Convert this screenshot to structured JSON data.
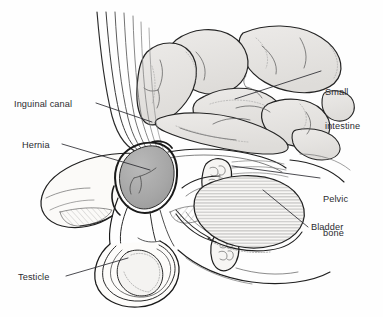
{
  "figure": {
    "style": "medical line drawing, grayscale",
    "background_color": "#fefefe",
    "ink_color": "#1a1a1a",
    "text_color": "#2b2b30"
  },
  "labels": [
    {
      "id": "inguinal-canal",
      "text": "Inguinal canal",
      "side": "left",
      "lines": [
        "Inguinal canal"
      ]
    },
    {
      "id": "hernia",
      "text": "Hernia",
      "side": "left",
      "lines": [
        "Hernia"
      ]
    },
    {
      "id": "testicle",
      "text": "Testicle",
      "side": "left",
      "lines": [
        "Testicle"
      ]
    },
    {
      "id": "small-intestine",
      "text": "Small intestine",
      "side": "right",
      "lines": [
        "Small",
        "intestine"
      ]
    },
    {
      "id": "pelvic-bone",
      "text": "Pelvic bone",
      "side": "right",
      "lines": [
        "Pelvic",
        "bone"
      ]
    },
    {
      "id": "bladder",
      "text": "Bladder",
      "side": "right",
      "lines": [
        "Bladder"
      ]
    }
  ],
  "label_text": {
    "inguinal_canal": "Inguinal canal",
    "hernia": "Hernia",
    "testicle": "Testicle",
    "small_intestine_line1": "Small",
    "small_intestine_line2": "intestine",
    "pelvic_bone_line1": "Pelvic",
    "pelvic_bone_line2": "bone",
    "bladder": "Bladder"
  },
  "structures": [
    {
      "name": "small-intestine",
      "fill": "#e6e5e3",
      "note": "coiled loops of bowel filling the upper right abdomen"
    },
    {
      "name": "hernia-sac",
      "fill": "#a9a9a9",
      "note": "darker shaded teardrop bulge protruding through the canal"
    },
    {
      "name": "pelvic-bone",
      "fill": "#f4f3f1",
      "note": "two cut cross-sections with trabecular stipple"
    },
    {
      "name": "bladder",
      "fill": "#f6f5f3",
      "note": "oval organ with fine horizontal hatching"
    },
    {
      "name": "testicle",
      "fill": "#f4f3f1",
      "note": "oval inside the scrotal sac"
    },
    {
      "name": "abdominal-wall",
      "fill": "#fbfaf8",
      "note": "muscle fibers sweeping down into the inguinal canal"
    },
    {
      "name": "spermatic-cord",
      "fill": "none",
      "note": "twin lines running from canal to testicle"
    }
  ],
  "leader_lines": [
    {
      "for": "inguinal-canal",
      "from": [
        96,
        103
      ],
      "to": [
        152,
        122
      ]
    },
    {
      "for": "hernia",
      "from": [
        62,
        144
      ],
      "to": [
        150,
        170
      ]
    },
    {
      "for": "testicle",
      "from": [
        66,
        276
      ],
      "to": [
        128,
        258
      ]
    },
    {
      "for": "small-intestine",
      "from": [
        321,
        71
      ],
      "to": [
        235,
        99
      ]
    },
    {
      "for": "pelvic-bone",
      "from": [
        320,
        178
      ],
      "to": [
        232,
        166
      ]
    },
    {
      "for": "bladder",
      "from": [
        308,
        227
      ],
      "to": [
        263,
        190
      ]
    }
  ]
}
